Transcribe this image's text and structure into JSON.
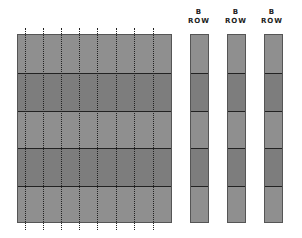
{
  "diagram": {
    "main_grid": {
      "rows": 5,
      "dotted_columns": 8,
      "row_colors": [
        "#8f8f8f",
        "#7d7d7d",
        "#8f8f8f",
        "#7d7d7d",
        "#8f8f8f"
      ]
    },
    "columns": [
      {
        "label_line1": "B",
        "label_line2": "ROW"
      },
      {
        "label_line1": "B",
        "label_line2": "ROW"
      },
      {
        "label_line1": "B",
        "label_line2": "ROW"
      }
    ],
    "column_row_colors": [
      "#8f8f8f",
      "#7d7d7d",
      "#8f8f8f",
      "#7d7d7d",
      "#8f8f8f"
    ]
  }
}
